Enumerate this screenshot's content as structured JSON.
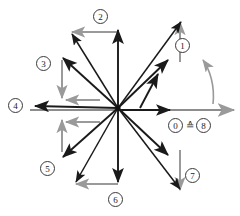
{
  "figure": {
    "center": {
      "x": 118,
      "y": 108
    },
    "radius": 88,
    "colors": {
      "vector": "#1a1a1a",
      "component": "#9a9a9a",
      "axis": "#7d7d7d",
      "label_border": "#3a3a3a",
      "background": "#ffffff"
    },
    "vectors": [
      {
        "id": "1",
        "angle_deg": 45,
        "label": "1"
      },
      {
        "id": "2",
        "angle_deg": 90,
        "label": "2"
      },
      {
        "id": "3",
        "angle_deg": 135,
        "label": "3"
      },
      {
        "id": "4",
        "angle_deg": 180,
        "label": "4"
      },
      {
        "id": "5",
        "angle_deg": 225,
        "label": "5"
      },
      {
        "id": "6",
        "angle_deg": 270,
        "label": "6"
      },
      {
        "id": "7",
        "angle_deg": 315,
        "label": "7"
      },
      {
        "id": "8",
        "angle_deg": 0,
        "label": "8"
      }
    ],
    "labels": [
      {
        "text": "1",
        "x": 175,
        "y": 38
      },
      {
        "text": "2",
        "x": 93,
        "y": 9
      },
      {
        "text": "3",
        "x": 36,
        "y": 56
      },
      {
        "text": "4",
        "x": 8,
        "y": 98
      },
      {
        "text": "5",
        "x": 40,
        "y": 161
      },
      {
        "text": "6",
        "x": 108,
        "y": 192
      },
      {
        "text": "7",
        "x": 185,
        "y": 168
      },
      {
        "text": "0",
        "x": 168,
        "y": 118
      },
      {
        "text": "8",
        "x": 199,
        "y": 118
      }
    ],
    "equivalence": {
      "left_label": "0",
      "symbol": "≙",
      "right_label": "8",
      "symbol_x": 186,
      "symbol_y": 118
    },
    "rotation_arc": {
      "present": true,
      "description": "curved gray arrow indicating rotation direction",
      "from_x": 213,
      "from_y": 104,
      "to_x": 202,
      "to_y": 60
    }
  }
}
